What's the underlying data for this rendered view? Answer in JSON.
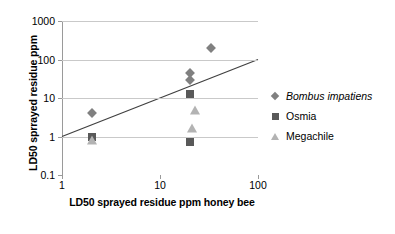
{
  "chart_data": {
    "type": "scatter",
    "title": "",
    "xlabel": "LD50 sprayed residue ppm honey bee",
    "ylabel": "LD50 sprrayed residue ppm",
    "xscale": "log",
    "yscale": "log",
    "xlim": [
      1,
      100
    ],
    "ylim": [
      0.1,
      1000
    ],
    "xticks": [
      "1",
      "10",
      "100"
    ],
    "yticks": [
      "1000",
      "100",
      "10",
      "1",
      "0.1"
    ],
    "grid": "horizontal",
    "legend_position": "right",
    "series": [
      {
        "name": "Bombus impatiens",
        "marker": "diamond",
        "color": "#808080",
        "italic": true,
        "points": [
          {
            "x": 2,
            "y": 4
          },
          {
            "x": 20,
            "y": 45
          },
          {
            "x": 20,
            "y": 30
          },
          {
            "x": 33,
            "y": 200
          }
        ]
      },
      {
        "name": "Osmia",
        "marker": "square",
        "color": "#595959",
        "italic": false,
        "points": [
          {
            "x": 2,
            "y": 1
          },
          {
            "x": 20,
            "y": 13
          },
          {
            "x": 20,
            "y": 0.7
          }
        ]
      },
      {
        "name": "Megachile",
        "marker": "triangle",
        "color": "#b3b3b3",
        "italic": false,
        "points": [
          {
            "x": 2,
            "y": 0.8
          },
          {
            "x": 23,
            "y": 5
          },
          {
            "x": 21,
            "y": 1.7
          }
        ]
      }
    ],
    "trendline": {
      "from": {
        "x": 1,
        "y": 1
      },
      "to": {
        "x": 100,
        "y": 100
      },
      "color": "#404040"
    }
  }
}
